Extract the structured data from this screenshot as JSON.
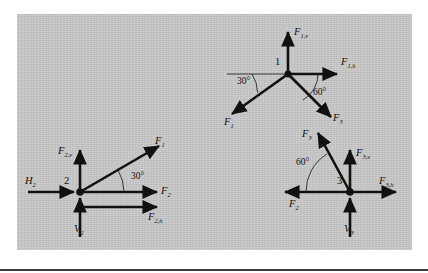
{
  "figure": {
    "panel": {
      "background": "#c9c9c9",
      "x": 17,
      "y": 14,
      "width": 395,
      "height": 236
    },
    "stroke_color": "#111111",
    "rule_color": "#3c3c3c"
  },
  "nodes": [
    {
      "id": "node-1",
      "number": "1",
      "center": {
        "x": 288,
        "y": 74
      },
      "labels": {
        "vertical": {
          "base": "F",
          "sub": "1,v"
        },
        "horizontal": {
          "base": "F",
          "sub": "1,h"
        },
        "member_left": {
          "base": "F",
          "sub": "1"
        },
        "member_right": {
          "base": "F",
          "sub": "3"
        }
      },
      "angles": [
        {
          "value": "30°",
          "from": "horizontal-left",
          "to": "F1"
        },
        {
          "value": "60°",
          "from": "horizontal-right",
          "to": "F3"
        }
      ]
    },
    {
      "id": "node-2",
      "number": "2",
      "center": {
        "x": 80,
        "y": 192
      },
      "labels": {
        "reaction_horizontal": {
          "base": "H",
          "sub": "2"
        },
        "reaction_vertical": {
          "base": "V",
          "sub": "2"
        },
        "vertical": {
          "base": "F",
          "sub": "2,v"
        },
        "horizontal": {
          "base": "F",
          "sub": "2,h"
        },
        "member_axial": {
          "base": "F",
          "sub": "2"
        },
        "member_diagonal": {
          "base": "F",
          "sub": "1"
        }
      },
      "angles": [
        {
          "value": "30°",
          "from": "horizontal-right",
          "to": "F1"
        }
      ]
    },
    {
      "id": "node-3",
      "number": "3",
      "center": {
        "x": 350,
        "y": 192
      },
      "labels": {
        "reaction_vertical": {
          "base": "V",
          "sub": "3"
        },
        "vertical": {
          "base": "F",
          "sub": "3,v"
        },
        "horizontal": {
          "base": "F",
          "sub": "3,h"
        },
        "member_axial": {
          "base": "F",
          "sub": "2"
        },
        "member_diagonal": {
          "base": "F",
          "sub": "3"
        }
      },
      "angles": [
        {
          "value": "60°",
          "from": "horizontal-left",
          "to": "F3"
        }
      ]
    }
  ],
  "labels_flat": {
    "n1_Fv": "F1,v",
    "n1_Fh": "F1,h",
    "n1_F1": "F1",
    "n1_F3": "F3",
    "n1_a30": "30°",
    "n1_a60": "60°",
    "n2_H2": "H2",
    "n2_V2": "V2",
    "n2_Fv": "F2,v",
    "n2_Fh": "F2,h",
    "n2_F2": "F2",
    "n2_F1": "F1",
    "n2_num": "2",
    "n2_a30": "30°",
    "n1_num": "1",
    "n3_V3": "V3",
    "n3_Fv": "F3,v",
    "n3_Fh": "F3,h",
    "n3_F2": "F2",
    "n3_F3": "F3",
    "n3_num": "3",
    "n3_a60": "60°"
  }
}
